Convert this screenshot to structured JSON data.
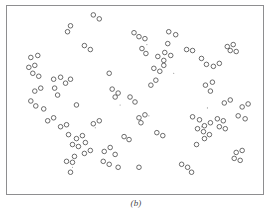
{
  "figure": {
    "caption": "(b)",
    "frame_color": "#8e8e90",
    "background_color": "#ffffff",
    "marker_color": "#595959",
    "marker_shape": "open-circle"
  },
  "chart_data": {
    "type": "scatter",
    "title": "",
    "subtitle": "",
    "xlabel": "",
    "ylabel": "",
    "xlim": [
      0,
      258
    ],
    "ylim": [
      0,
      190
    ],
    "grid": false,
    "legend_position": "none",
    "annotations": [
      "(b)"
    ],
    "marker": {
      "shape": "open-circle",
      "radius": 2.3,
      "stroke": "#595959",
      "stroke_width": 0.9,
      "fill": "none"
    },
    "dust_marker": {
      "shape": "dot",
      "radius": 0.55,
      "fill": "#8a8a8a"
    },
    "series": [
      {
        "name": "points",
        "n": 118,
        "points": [
          [
            87,
            9
          ],
          [
            93,
            13
          ],
          [
            64,
            20
          ],
          [
            61,
            26
          ],
          [
            128,
            27
          ],
          [
            133,
            31
          ],
          [
            139,
            33
          ],
          [
            163,
            26
          ],
          [
            170,
            29
          ],
          [
            78,
            40
          ],
          [
            84,
            44
          ],
          [
            136,
            43
          ],
          [
            140,
            48
          ],
          [
            162,
            38
          ],
          [
            181,
            44
          ],
          [
            187,
            45
          ],
          [
            222,
            41
          ],
          [
            228,
            39
          ],
          [
            225,
            45
          ],
          [
            231,
            46
          ],
          [
            152,
            51
          ],
          [
            158,
            55
          ],
          [
            196,
            53
          ],
          [
            201,
            59
          ],
          [
            148,
            63
          ],
          [
            154,
            66
          ],
          [
            158,
            60
          ],
          [
            24,
            52
          ],
          [
            31,
            50
          ],
          [
            22,
            62
          ],
          [
            28,
            60
          ],
          [
            26,
            68
          ],
          [
            32,
            71
          ],
          [
            103,
            68
          ],
          [
            47,
            74
          ],
          [
            54,
            72
          ],
          [
            59,
            78
          ],
          [
            64,
            74
          ],
          [
            48,
            83
          ],
          [
            28,
            86
          ],
          [
            34,
            83
          ],
          [
            51,
            90
          ],
          [
            24,
            96
          ],
          [
            29,
            101
          ],
          [
            37,
            104
          ],
          [
            106,
            84
          ],
          [
            112,
            88
          ],
          [
            109,
            92
          ],
          [
            124,
            92
          ],
          [
            129,
            97
          ],
          [
            70,
            100
          ],
          [
            200,
            80
          ],
          [
            207,
            77
          ],
          [
            205,
            86
          ],
          [
            133,
            113
          ],
          [
            139,
            110
          ],
          [
            135,
            118
          ],
          [
            187,
            112
          ],
          [
            194,
            115
          ],
          [
            199,
            121
          ],
          [
            205,
            118
          ],
          [
            192,
            124
          ],
          [
            198,
            127
          ],
          [
            212,
            114
          ],
          [
            218,
            116
          ],
          [
            214,
            122
          ],
          [
            220,
            124
          ],
          [
            233,
            111
          ],
          [
            240,
            114
          ],
          [
            54,
            122
          ],
          [
            60,
            120
          ],
          [
            62,
            130
          ],
          [
            70,
            134
          ],
          [
            76,
            131
          ],
          [
            66,
            140
          ],
          [
            72,
            142
          ],
          [
            79,
            138
          ],
          [
            84,
            146
          ],
          [
            78,
            149
          ],
          [
            68,
            152
          ],
          [
            60,
            157
          ],
          [
            66,
            158
          ],
          [
            98,
            147
          ],
          [
            104,
            143
          ],
          [
            109,
            150
          ],
          [
            97,
            157
          ],
          [
            103,
            160
          ],
          [
            112,
            163
          ],
          [
            133,
            163
          ],
          [
            64,
            168
          ],
          [
            191,
            140
          ],
          [
            176,
            160
          ],
          [
            182,
            163
          ],
          [
            186,
            168
          ],
          [
            231,
            148
          ],
          [
            237,
            146
          ],
          [
            229,
            154
          ],
          [
            235,
            156
          ],
          [
            199,
            134
          ],
          [
            204,
            130
          ],
          [
            150,
            75
          ],
          [
            145,
            80
          ],
          [
            208,
            61
          ],
          [
            214,
            58
          ],
          [
            41,
            116
          ],
          [
            47,
            113
          ],
          [
            118,
            132
          ],
          [
            123,
            135
          ],
          [
            165,
            50
          ],
          [
            159,
            47
          ],
          [
            219,
            98
          ],
          [
            225,
            95
          ],
          [
            237,
            102
          ],
          [
            243,
            99
          ],
          [
            87,
            119
          ],
          [
            93,
            116
          ],
          [
            151,
            128
          ],
          [
            157,
            131
          ]
        ]
      }
    ],
    "dust_points": [
      [
        141,
        39
      ],
      [
        89,
        123
      ],
      [
        143,
        111
      ],
      [
        202,
        103
      ],
      [
        114,
        100
      ],
      [
        66,
        163
      ],
      [
        196,
        122
      ],
      [
        168,
        68
      ]
    ]
  }
}
